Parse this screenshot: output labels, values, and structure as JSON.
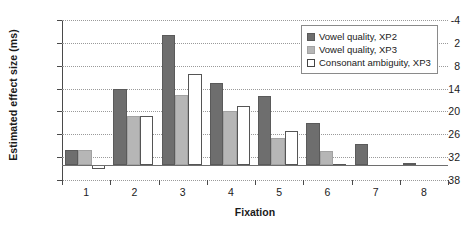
{
  "chart_data": {
    "type": "bar",
    "title": "",
    "xlabel": "Fixation",
    "ylabel": "Estimated effect size (ms)",
    "categories": [
      "1",
      "2",
      "3",
      "4",
      "5",
      "6",
      "7",
      "8"
    ],
    "ylim": [
      -4,
      38
    ],
    "yticks": [
      -4,
      2,
      8,
      14,
      20,
      26,
      32,
      38
    ],
    "grid": true,
    "legend_position": "top-right",
    "series": [
      {
        "name": "Vowel quality, XP2",
        "color": "#6e6e6e",
        "values": [
          4.0,
          19.8,
          34.0,
          21.5,
          18.0,
          11.0,
          5.5,
          0.4
        ]
      },
      {
        "name": "Vowel quality, XP3",
        "color": "#b6b6b6",
        "values": [
          3.8,
          12.8,
          18.2,
          14.0,
          7.0,
          3.5,
          0.0,
          0.0
        ]
      },
      {
        "name": "Consonant ambiguity, XP3",
        "color": "#ffffff",
        "values": [
          -1.2,
          12.8,
          23.7,
          15.3,
          8.8,
          0.3,
          0.0,
          0.0
        ]
      }
    ]
  },
  "legend": {
    "items": [
      {
        "label": "Vowel quality, XP2"
      },
      {
        "label": "Vowel quality, XP3"
      },
      {
        "label": "Consonant ambiguity, XP3"
      }
    ]
  },
  "axes": {
    "y_title": "Estimated effect size (ms)",
    "x_title": "Fixation",
    "y_tick_labels": [
      "38",
      "32",
      "26",
      "20",
      "14",
      "8",
      "2",
      "-4"
    ],
    "x_tick_labels": [
      "1",
      "2",
      "3",
      "4",
      "5",
      "6",
      "7",
      "8"
    ]
  }
}
